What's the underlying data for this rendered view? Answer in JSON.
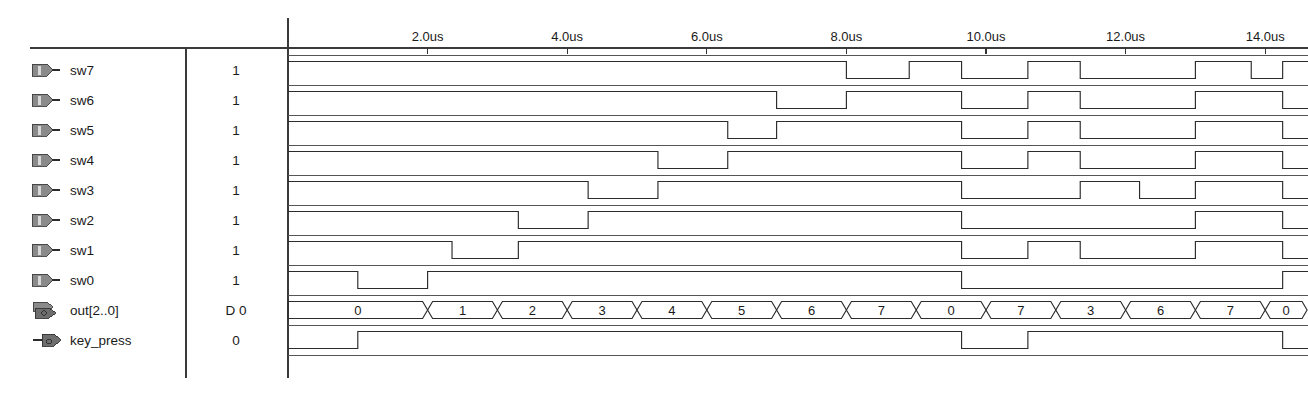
{
  "window": {
    "title": "Waveform Simulation Report"
  },
  "axis": {
    "unit": "us",
    "start_time": 0,
    "end_time": 14.6,
    "tick_interval": 2,
    "tick_labels": [
      "2.0us",
      "4.0us",
      "6.0us",
      "8.0us",
      "10.0us",
      "12.0us",
      "14.0us"
    ],
    "tick_times": [
      2,
      4,
      6,
      8,
      10,
      12,
      14
    ]
  },
  "columns": {
    "name_header": "",
    "value_header": ""
  },
  "signals": [
    {
      "name": "sw7",
      "value": "1",
      "icon": "input-pin-icon",
      "type": "bit",
      "initial": 1,
      "edges": [
        8.0,
        8.9,
        9.65,
        10.6,
        11.35,
        13.0,
        13.8,
        14.25
      ]
    },
    {
      "name": "sw6",
      "value": "1",
      "icon": "input-pin-icon",
      "type": "bit",
      "initial": 1,
      "edges": [
        7.0,
        8.0,
        9.65,
        10.6,
        11.35,
        13.0,
        14.25
      ]
    },
    {
      "name": "sw5",
      "value": "1",
      "icon": "input-pin-icon",
      "type": "bit",
      "initial": 1,
      "edges": [
        6.3,
        7.0,
        9.65,
        10.6,
        11.35,
        13.0,
        14.25
      ]
    },
    {
      "name": "sw4",
      "value": "1",
      "icon": "input-pin-icon",
      "type": "bit",
      "initial": 1,
      "edges": [
        5.3,
        6.3,
        9.65,
        10.6,
        11.35,
        13.0,
        14.25
      ]
    },
    {
      "name": "sw3",
      "value": "1",
      "icon": "input-pin-icon",
      "type": "bit",
      "initial": 1,
      "edges": [
        4.3,
        5.3,
        9.65,
        11.35,
        12.2,
        13.0,
        14.25
      ]
    },
    {
      "name": "sw2",
      "value": "1",
      "icon": "input-pin-icon",
      "type": "bit",
      "initial": 1,
      "edges": [
        3.3,
        4.3,
        9.65,
        13.0,
        14.25
      ]
    },
    {
      "name": "sw1",
      "value": "1",
      "icon": "input-pin-icon",
      "type": "bit",
      "initial": 1,
      "edges": [
        2.35,
        3.3,
        9.65,
        10.6,
        11.35,
        13.0,
        14.25
      ]
    },
    {
      "name": "sw0",
      "value": "1",
      "icon": "input-pin-icon",
      "type": "bit",
      "initial": 1,
      "edges": [
        1.0,
        2.0,
        9.65,
        14.25
      ]
    },
    {
      "name": "out[2..0]",
      "value": "D 0",
      "icon": "output-bus-icon",
      "type": "bus",
      "segments": [
        {
          "label": "0",
          "start": 0.0,
          "end": 2.0
        },
        {
          "label": "1",
          "start": 2.0,
          "end": 3.0
        },
        {
          "label": "2",
          "start": 3.0,
          "end": 4.0
        },
        {
          "label": "3",
          "start": 4.0,
          "end": 5.0
        },
        {
          "label": "4",
          "start": 5.0,
          "end": 6.0
        },
        {
          "label": "5",
          "start": 6.0,
          "end": 7.0
        },
        {
          "label": "6",
          "start": 7.0,
          "end": 8.0
        },
        {
          "label": "7",
          "start": 8.0,
          "end": 9.0
        },
        {
          "label": "0",
          "start": 9.0,
          "end": 10.0
        },
        {
          "label": "7",
          "start": 10.0,
          "end": 11.0
        },
        {
          "label": "3",
          "start": 11.0,
          "end": 12.0
        },
        {
          "label": "6",
          "start": 12.0,
          "end": 13.0
        },
        {
          "label": "7",
          "start": 13.0,
          "end": 14.0
        },
        {
          "label": "0",
          "start": 14.0,
          "end": 14.6
        }
      ]
    },
    {
      "name": "key_press",
      "value": "0",
      "icon": "output-pin-icon",
      "type": "bit",
      "initial": 0,
      "edges": [
        1.0,
        9.65,
        10.6,
        14.25
      ]
    }
  ],
  "colors": {
    "waveform_stroke": "#2b2b2b",
    "grid": "#555555",
    "background": "#ffffff",
    "text": "#1a1a1a",
    "icon_fill": "#8a8a8a"
  },
  "geometry": {
    "name_col_x": 30,
    "value_col_x": 188,
    "wave_col_x": 288,
    "wave_right": 1308,
    "header_y": 48,
    "row_height": 30,
    "first_row_y": 55,
    "px_per_us": 69.8
  }
}
